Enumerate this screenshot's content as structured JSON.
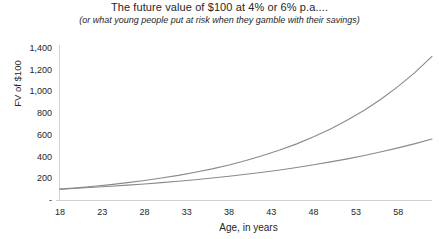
{
  "chart_data": {
    "type": "line",
    "title": "The future value of $100 at 4% or 6% p.a....",
    "subtitle": "(or what young people put at risk when they gamble with their savings)",
    "xlabel": "Age, in years",
    "ylabel": "FV of $100",
    "xlim": [
      18,
      62
    ],
    "ylim": [
      0,
      1400
    ],
    "grid": false,
    "legend": "none",
    "line_color": "#8a8a8a",
    "axis_color": "#d0d0d0",
    "ytick_labels": [
      "1,400",
      "1,200",
      "1,000",
      "800",
      "600",
      "400",
      "200",
      "-"
    ],
    "ytick_values": [
      1400,
      1200,
      1000,
      800,
      600,
      400,
      200,
      0
    ],
    "xtick_labels": [
      "18",
      "23",
      "28",
      "33",
      "38",
      "43",
      "48",
      "53",
      "58"
    ],
    "xtick_values": [
      18,
      23,
      28,
      33,
      38,
      43,
      48,
      53,
      58
    ],
    "x": [
      18,
      20,
      22,
      24,
      26,
      28,
      30,
      32,
      34,
      36,
      38,
      40,
      42,
      44,
      46,
      48,
      50,
      52,
      54,
      56,
      58,
      60,
      62
    ],
    "series": [
      {
        "name": "6% p.a.",
        "rate": 0.06,
        "values": [
          100,
          112,
          126,
          142,
          160,
          180,
          202,
          227,
          256,
          287,
          323,
          363,
          409,
          460,
          517,
          582,
          654,
          736,
          827,
          930,
          1046,
          1176,
          1323
        ]
      },
      {
        "name": "4% p.a.",
        "rate": 0.04,
        "values": [
          100,
          108,
          117,
          127,
          137,
          148,
          160,
          173,
          187,
          203,
          219,
          237,
          256,
          277,
          300,
          324,
          351,
          379,
          410,
          444,
          480,
          519,
          561
        ]
      }
    ]
  }
}
